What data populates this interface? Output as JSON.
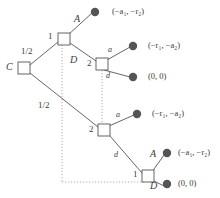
{
  "figure": {
    "type": "game-tree-diagram",
    "stroke_color": "#4a4a4a",
    "terminal_node_color": "#555555",
    "info_set_color": "#999999"
  },
  "nodes": {
    "chance_root": {
      "label": "C",
      "x": 24,
      "y": 68
    },
    "player1_top": {
      "label": "1",
      "x": 64,
      "y": 39
    },
    "player2_upper": {
      "label": "2",
      "x": 102,
      "y": 64
    },
    "player2_lower": {
      "label": "2",
      "x": 104,
      "y": 130
    },
    "player1_bottom": {
      "label": "1",
      "x": 148,
      "y": 176
    }
  },
  "probabilities": {
    "upper_branch": "1/2",
    "lower_branch": "1/2"
  },
  "actions": {
    "top_A": "A",
    "top_D": "D",
    "upper_a": "a",
    "upper_d": "d",
    "lower_a": "a",
    "lower_d": "d",
    "bottom_A": "A",
    "bottom_D": "D"
  },
  "payoffs": [
    {
      "id": "payoff-top-A",
      "text": "(−a₁, −r₂)",
      "x": 112,
      "y": 9,
      "dot_x": 95,
      "dot_y": 12
    },
    {
      "id": "payoff-upper-a",
      "text": "(−r₁, −a₂)",
      "x": 148,
      "y": 43,
      "dot_x": 133,
      "dot_y": 46
    },
    {
      "id": "payoff-upper-d",
      "text": "(0, 0)",
      "x": 148,
      "y": 74,
      "dot_x": 133,
      "dot_y": 77
    },
    {
      "id": "payoff-lower-a",
      "text": "(−r₁, −a₂)",
      "x": 152,
      "y": 111,
      "dot_x": 137,
      "dot_y": 114
    },
    {
      "id": "payoff-bottom-A",
      "text": "(−a₁, −r₂)",
      "x": 178,
      "y": 150,
      "dot_x": 167,
      "dot_y": 153
    },
    {
      "id": "payoff-bottom-D",
      "text": "(0, 0)",
      "x": 178,
      "y": 181,
      "dot_x": 167,
      "dot_y": 184
    }
  ],
  "information_sets": [
    {
      "id": "info-set-player1",
      "description": "links player 1 top node to player 1 bottom node"
    },
    {
      "id": "info-set-player2",
      "description": "links player 2 upper node to player 2 lower node"
    }
  ]
}
